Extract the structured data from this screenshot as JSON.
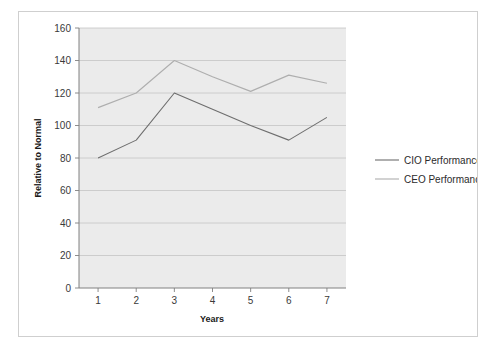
{
  "chart_data": {
    "type": "line",
    "title": "",
    "xlabel": "Years",
    "ylabel": "Relative to Normal",
    "x": [
      1,
      2,
      3,
      4,
      5,
      6,
      7
    ],
    "xtick_labels": [
      "1",
      "2",
      "3",
      "4",
      "5",
      "6",
      "7"
    ],
    "ytick_labels": [
      "0",
      "20",
      "40",
      "60",
      "80",
      "100",
      "120",
      "140",
      "160"
    ],
    "ytick_values": [
      0,
      20,
      40,
      60,
      80,
      100,
      120,
      140,
      160
    ],
    "ylim": [
      0,
      160
    ],
    "xlim": [
      0.5,
      7.5
    ],
    "grid": "horizontal",
    "legend_position": "right",
    "series": [
      {
        "name": "CIO Performance",
        "color": "#6e6e6e",
        "values": [
          80,
          91,
          120,
          110,
          100,
          91,
          105
        ]
      },
      {
        "name": "CEO Performance",
        "color": "#aeaeae",
        "values": [
          111,
          120,
          140,
          130,
          121,
          131,
          126
        ]
      }
    ]
  },
  "legend": {
    "items": [
      {
        "label": "CIO Performance",
        "color": "#6e6e6e"
      },
      {
        "label": "CEO Performance",
        "color": "#aeaeae"
      }
    ]
  },
  "colors": {
    "plot_background": "#ebebeb",
    "gridline": "#c4c4c4",
    "axis": "#808080",
    "figure_border": "#cfcfcf",
    "text": "#1a1a1a"
  }
}
